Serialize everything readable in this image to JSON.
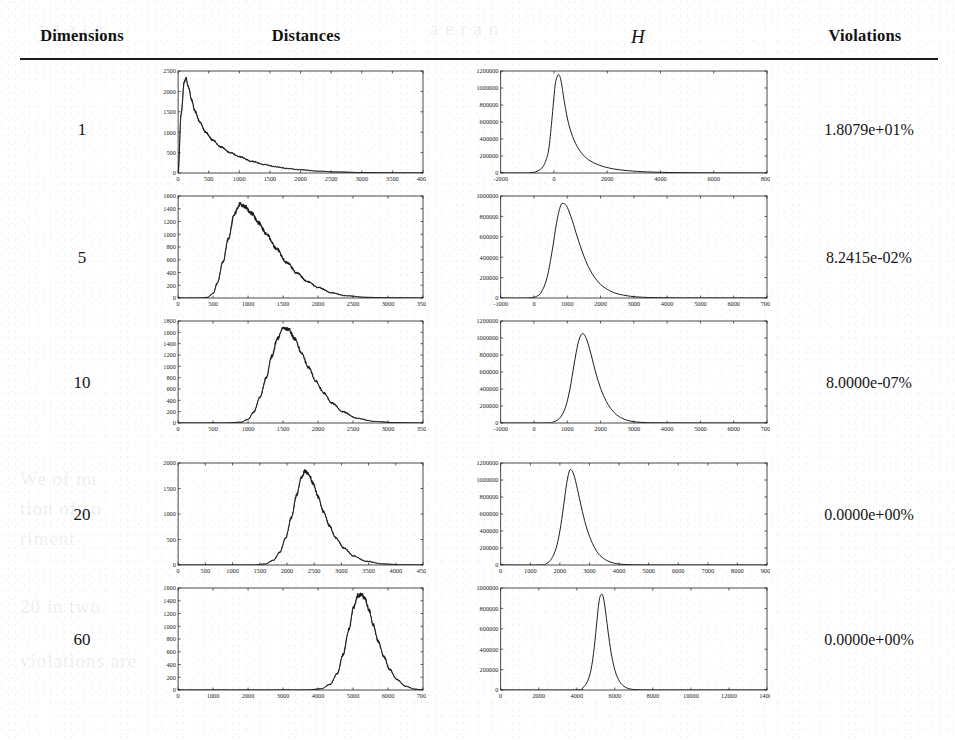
{
  "header": {
    "col_dimensions": "Dimensions",
    "col_distances": "Distances",
    "col_h": "H",
    "col_violations": "Violations"
  },
  "rows": [
    {
      "dimension": "1",
      "violations": "1.8079e+01%"
    },
    {
      "dimension": "5",
      "violations": "8.2415e-02%"
    },
    {
      "dimension": "10",
      "violations": "8.0000e-07%"
    },
    {
      "dimension": "20",
      "violations": "0.0000e+00%"
    },
    {
      "dimension": "60",
      "violations": "0.0000e+00%"
    }
  ],
  "chart_data": [
    {
      "type": "line",
      "title": "Distances (Dimensions = 1)",
      "xlabel": "",
      "ylabel": "",
      "xlim": [
        0,
        4000
      ],
      "ylim": [
        0,
        2500
      ],
      "xticks": [
        0,
        500,
        1000,
        1500,
        2000,
        2500,
        3000,
        3500,
        4000
      ],
      "yticks": [
        0,
        500,
        1000,
        1500,
        2000,
        2500
      ],
      "grid": false,
      "x": [
        0,
        50,
        100,
        130,
        170,
        220,
        280,
        350,
        450,
        560,
        700,
        850,
        1000,
        1200,
        1400,
        1600,
        1800,
        2000,
        2300,
        2600,
        3000,
        3500,
        4000
      ],
      "values": [
        0,
        1450,
        2240,
        2310,
        2100,
        1790,
        1500,
        1260,
        1000,
        810,
        640,
        500,
        400,
        290,
        210,
        150,
        108,
        78,
        44,
        25,
        11,
        4,
        1
      ],
      "noisy": true
    },
    {
      "type": "line",
      "title": "H (Dimensions = 1)",
      "xlabel": "",
      "ylabel": "",
      "xlim": [
        -2000,
        8000
      ],
      "ylim": [
        0,
        1200000
      ],
      "xticks": [
        -2000,
        0,
        2000,
        4000,
        6000,
        8000
      ],
      "yticks": [
        0,
        200000,
        400000,
        600000,
        800000,
        1000000,
        1200000
      ],
      "grid": false,
      "x": [
        -2000,
        -1200,
        -900,
        -700,
        -500,
        -350,
        -200,
        -80,
        40,
        130,
        200,
        280,
        400,
        550,
        750,
        1000,
        1300,
        1700,
        2200,
        2800,
        3500,
        4500,
        6000,
        8000
      ],
      "values": [
        0,
        0,
        2000,
        12000,
        45000,
        110000,
        270000,
        620000,
        1020000,
        1140000,
        1150000,
        1060000,
        820000,
        580000,
        390000,
        250000,
        155000,
        92000,
        50000,
        27000,
        13000,
        5000,
        1200,
        200
      ],
      "noisy": false
    },
    {
      "type": "line",
      "title": "Distances (Dimensions = 5)",
      "xlabel": "",
      "ylabel": "",
      "xlim": [
        0,
        3500
      ],
      "ylim": [
        0,
        1600
      ],
      "xticks": [
        0,
        500,
        1000,
        1500,
        2000,
        2500,
        3000,
        3500
      ],
      "yticks": [
        0,
        200,
        400,
        600,
        800,
        1000,
        1200,
        1400,
        1600
      ],
      "grid": false,
      "x": [
        0,
        300,
        420,
        500,
        560,
        640,
        720,
        800,
        880,
        950,
        1050,
        1150,
        1270,
        1400,
        1550,
        1700,
        1850,
        2000,
        2200,
        2400,
        2700,
        3000,
        3500
      ],
      "values": [
        0,
        0,
        10,
        70,
        230,
        560,
        930,
        1310,
        1470,
        1440,
        1330,
        1180,
        990,
        780,
        560,
        390,
        255,
        165,
        80,
        35,
        10,
        3,
        0
      ],
      "noisy": true
    },
    {
      "type": "line",
      "title": "H (Dimensions = 5)",
      "xlabel": "",
      "ylabel": "",
      "xlim": [
        -1000,
        7000
      ],
      "ylim": [
        0,
        1000000
      ],
      "xticks": [
        -1000,
        0,
        1000,
        2000,
        3000,
        4000,
        5000,
        6000,
        7000
      ],
      "yticks": [
        0,
        200000,
        400000,
        600000,
        800000,
        1000000
      ],
      "grid": false,
      "x": [
        -1000,
        -200,
        100,
        250,
        400,
        550,
        680,
        800,
        900,
        1000,
        1150,
        1300,
        1500,
        1700,
        1950,
        2200,
        2500,
        2900,
        3300,
        3900,
        4600,
        5500,
        7000
      ],
      "values": [
        0,
        0,
        20000,
        75000,
        210000,
        470000,
        740000,
        905000,
        925000,
        890000,
        760000,
        600000,
        410000,
        265000,
        150000,
        85000,
        42000,
        17000,
        7000,
        2000,
        600,
        150,
        20
      ],
      "noisy": false
    },
    {
      "type": "line",
      "title": "Distances (Dimensions = 10)",
      "xlabel": "",
      "ylabel": "",
      "xlim": [
        0,
        3500
      ],
      "ylim": [
        0,
        1800
      ],
      "xticks": [
        0,
        500,
        1000,
        1500,
        2000,
        2500,
        3000,
        3500
      ],
      "yticks": [
        0,
        200,
        400,
        600,
        800,
        1000,
        1200,
        1400,
        1600,
        1800
      ],
      "grid": false,
      "x": [
        0,
        700,
        900,
        1000,
        1080,
        1170,
        1260,
        1340,
        1420,
        1500,
        1580,
        1670,
        1760,
        1860,
        1970,
        2080,
        2200,
        2350,
        2550,
        2800,
        3100,
        3500
      ],
      "values": [
        0,
        0,
        15,
        65,
        190,
        450,
        800,
        1180,
        1490,
        1680,
        1650,
        1480,
        1250,
        990,
        740,
        530,
        350,
        200,
        85,
        28,
        7,
        0
      ],
      "noisy": true
    },
    {
      "type": "line",
      "title": "H (Dimensions = 10)",
      "xlabel": "",
      "ylabel": "",
      "xlim": [
        -1000,
        7000
      ],
      "ylim": [
        0,
        1200000
      ],
      "xticks": [
        -1000,
        0,
        1000,
        2000,
        3000,
        4000,
        5000,
        6000,
        7000
      ],
      "yticks": [
        0,
        200000,
        400000,
        600000,
        800000,
        1000000,
        1200000
      ],
      "grid": false,
      "x": [
        -1000,
        300,
        600,
        800,
        950,
        1080,
        1200,
        1320,
        1420,
        1500,
        1600,
        1720,
        1850,
        2000,
        2180,
        2380,
        2600,
        2900,
        3300,
        3800,
        4500,
        5500,
        7000
      ],
      "values": [
        0,
        0,
        15000,
        70000,
        190000,
        400000,
        680000,
        930000,
        1040000,
        1045000,
        965000,
        800000,
        600000,
        410000,
        250000,
        135000,
        65000,
        22000,
        6000,
        1500,
        300,
        50,
        0
      ],
      "noisy": false
    },
    {
      "type": "line",
      "title": "Distances (Dimensions = 20)",
      "xlabel": "",
      "ylabel": "",
      "xlim": [
        0,
        4500
      ],
      "ylim": [
        0,
        2000
      ],
      "xticks": [
        0,
        500,
        1000,
        1500,
        2000,
        2500,
        3000,
        3500,
        4000,
        4500
      ],
      "yticks": [
        0,
        500,
        1000,
        1500,
        2000
      ],
      "grid": false,
      "x": [
        0,
        1400,
        1600,
        1750,
        1870,
        1980,
        2080,
        2180,
        2260,
        2330,
        2400,
        2480,
        2570,
        2670,
        2780,
        2900,
        3050,
        3220,
        3450,
        3750,
        4100,
        4500
      ],
      "values": [
        0,
        0,
        20,
        90,
        250,
        540,
        930,
        1380,
        1700,
        1840,
        1790,
        1600,
        1340,
        1050,
        770,
        530,
        330,
        180,
        75,
        22,
        4,
        0
      ],
      "noisy": true
    },
    {
      "type": "line",
      "title": "H (Dimensions = 20)",
      "xlabel": "",
      "ylabel": "",
      "xlim": [
        0,
        9000
      ],
      "ylim": [
        0,
        1200000
      ],
      "xticks": [
        0,
        1000,
        2000,
        3000,
        4000,
        5000,
        6000,
        7000,
        8000,
        9000
      ],
      "yticks": [
        0,
        200000,
        400000,
        600000,
        800000,
        1000000,
        1200000
      ],
      "grid": false,
      "x": [
        0,
        1300,
        1550,
        1720,
        1870,
        2000,
        2120,
        2230,
        2320,
        2400,
        2500,
        2620,
        2760,
        2920,
        3100,
        3300,
        3550,
        3850,
        4250,
        4800,
        5600,
        7000,
        9000
      ],
      "values": [
        0,
        0,
        18000,
        75000,
        195000,
        400000,
        680000,
        960000,
        1105000,
        1115000,
        1030000,
        850000,
        630000,
        420000,
        255000,
        135000,
        60000,
        20000,
        5000,
        900,
        150,
        10,
        0
      ],
      "noisy": false
    },
    {
      "type": "line",
      "title": "Distances (Dimensions = 60)",
      "xlabel": "",
      "ylabel": "",
      "xlim": [
        0,
        7000
      ],
      "ylim": [
        0,
        1600
      ],
      "xticks": [
        0,
        1000,
        2000,
        3000,
        4000,
        5000,
        6000,
        7000
      ],
      "yticks": [
        0,
        200,
        400,
        600,
        800,
        1000,
        1200,
        1400,
        1600
      ],
      "grid": false,
      "x": [
        0,
        3700,
        4100,
        4350,
        4550,
        4720,
        4880,
        5020,
        5140,
        5250,
        5350,
        5460,
        5580,
        5720,
        5880,
        6050,
        6250,
        6500,
        6750,
        7000
      ],
      "values": [
        0,
        0,
        20,
        90,
        260,
        560,
        950,
        1300,
        1480,
        1500,
        1420,
        1250,
        1020,
        760,
        520,
        320,
        165,
        60,
        15,
        0
      ],
      "noisy": true
    },
    {
      "type": "line",
      "title": "H (Dimensions = 60)",
      "xlabel": "",
      "ylabel": "",
      "xlim": [
        0,
        14000
      ],
      "ylim": [
        0,
        1000000
      ],
      "xticks": [
        0,
        2000,
        4000,
        6000,
        8000,
        10000,
        12000,
        14000
      ],
      "yticks": [
        0,
        200000,
        400000,
        600000,
        800000,
        1000000
      ],
      "grid": false,
      "x": [
        0,
        3900,
        4300,
        4550,
        4750,
        4920,
        5060,
        5180,
        5280,
        5360,
        5450,
        5560,
        5690,
        5840,
        6010,
        6200,
        6420,
        6700,
        7100,
        7700,
        8600,
        11000,
        14000
      ],
      "values": [
        0,
        0,
        20000,
        80000,
        200000,
        420000,
        680000,
        880000,
        935000,
        930000,
        855000,
        700000,
        510000,
        330000,
        190000,
        100000,
        45000,
        15000,
        3500,
        600,
        80,
        0,
        0
      ],
      "noisy": false
    }
  ],
  "ghost_text": [
    "a t a t a",
    "a e r a n",
    "t h e n",
    "ation",
    "We of nu",
    "tion of so",
    "riment",
    "20 in two",
    "violations are"
  ]
}
